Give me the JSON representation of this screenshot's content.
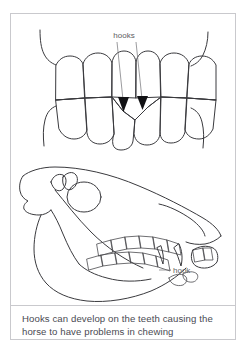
{
  "figure": {
    "title_alt": "Hooks on horse teeth",
    "background_color": "#ffffff",
    "frame_color": "#c9c9cd",
    "ink_color": "#3a3a3e",
    "arrow_color": "#111114",
    "label_color": "#5c5c60",
    "caption_color": "#4a4a52"
  },
  "panels": {
    "teeth": {
      "name": "teeth-front-view",
      "label": "hooks",
      "arrow_count": 2,
      "upper_teeth_count": 6,
      "lower_teeth_count": 6
    },
    "skull": {
      "name": "horse-skull-lateral-view",
      "label": "hook",
      "upper_cheek_teeth_count": 6,
      "lower_cheek_teeth_count": 6
    }
  },
  "caption": {
    "line1": "Hooks can develop on the teeth causing the",
    "line2": "horse to have problems in chewing",
    "full_text": "Hooks can develop on the teeth causing the horse to have problems in chewing"
  }
}
